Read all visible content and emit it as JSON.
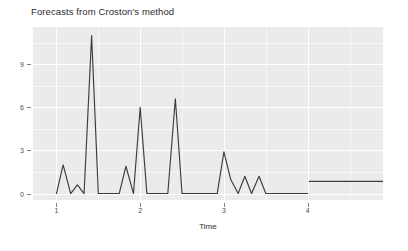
{
  "chart_data": {
    "type": "line",
    "title": "Forecasts from Croston's method",
    "xlabel": "Time",
    "ylabel": "",
    "xlim": [
      0.72,
      4.9
    ],
    "ylim": [
      -0.45,
      11.6
    ],
    "grid": true,
    "legend": null,
    "y_ticks": [
      0,
      3,
      6,
      9
    ],
    "y_tick_labels": [
      "0",
      "3",
      "6",
      "9"
    ],
    "x_ticks": [
      1,
      2,
      3,
      4
    ],
    "x_tick_labels": [
      "1",
      "2",
      "3",
      "4"
    ],
    "y_minor_ticks": [
      1.5,
      4.5,
      7.5,
      10.5
    ],
    "x_minor_ticks": [
      1.5,
      2.5,
      3.5,
      4.5
    ],
    "series": [
      {
        "name": "Historical demand",
        "color": "#3d3d3d",
        "x": [
          1.0,
          1.08,
          1.17,
          1.25,
          1.33,
          1.42,
          1.5,
          1.58,
          1.67,
          1.75,
          1.83,
          1.92,
          2.0,
          2.08,
          2.17,
          2.25,
          2.33,
          2.42,
          2.5,
          2.58,
          2.67,
          2.75,
          2.83,
          2.92,
          3.0,
          3.08,
          3.17,
          3.25,
          3.33,
          3.42,
          3.5,
          3.58,
          3.67,
          3.75,
          3.83,
          3.92,
          4.0
        ],
        "values": [
          0.0,
          2.0,
          0.0,
          0.6,
          0.0,
          11.0,
          0.0,
          0.0,
          0.0,
          0.0,
          1.9,
          0.0,
          6.0,
          0.0,
          0.0,
          0.0,
          0.0,
          6.6,
          0.0,
          0.0,
          0.0,
          0.0,
          0.0,
          0.0,
          2.9,
          1.0,
          0.0,
          1.2,
          0.0,
          1.2,
          0.0,
          0.0,
          0.0,
          0.0,
          0.0,
          0.0,
          0.0
        ]
      },
      {
        "name": "Croston forecast",
        "color": "#3d3d3d",
        "x": [
          4.02,
          4.9
        ],
        "values": [
          0.85,
          0.85
        ]
      }
    ]
  },
  "chart": {
    "title": "Forecasts from Croston's method",
    "x_axis_title": "Time"
  }
}
